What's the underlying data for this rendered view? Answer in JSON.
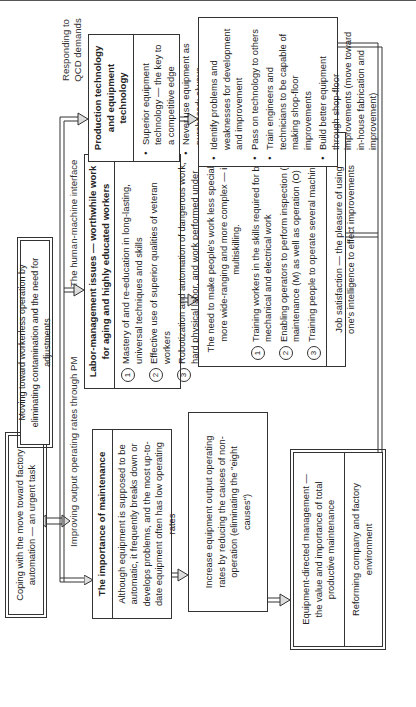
{
  "diagram": {
    "caption": "",
    "start_box": {
      "text": "Coping with the move toward factory automation — an urgent task"
    },
    "moving_box": {
      "text": "Moving toward workerless operation by eliminating contamination and the need for adjustments"
    },
    "labels": {
      "improving": "Improving output operating rates through PM",
      "human_machine": "The human-machine interface",
      "responding": "Responding to QCD demands"
    },
    "maintenance_box": {
      "title": "The importance of maintenance",
      "text": "Although equipment is supposed to be automatic, it frequently breaks down or develops problems, and the most up-to-date equipment often has low operating rates"
    },
    "increase_box": {
      "text": "Increase equipment output operating rates by reducing the causes of non-operation (eliminating the \"eight causes\")"
    },
    "equipment_box": {
      "main": "Equipment-directed management — the value and importance of total productive maintenance",
      "sub": "Reforming company and factory environment"
    },
    "labor_box": {
      "title": "Labor-management issues — worthwhile work for aging and highly educated workers",
      "items": [
        {
          "num": "1",
          "text": "Mastery of and re-education in long-lasting, universal techniques and skills"
        },
        {
          "num": "2",
          "text": "Effective use of superior qualities of veteran workers"
        },
        {
          "num": "3",
          "text": "Robotization and automation of dangerous work, hard physical labor, and work performed under unhealthy environmental conditions"
        }
      ]
    },
    "multiskill_box": {
      "intro": "The need to make people's work less specialized, more wide-ranging and more complex — i.e. multiskilling.",
      "items": [
        {
          "num": "1",
          "text": "Training workers in the skills required for both mechanical and electrical work"
        },
        {
          "num": "2",
          "text": "Enabling operators to perform inspection (I) and maintenance (M) as well as operation (O)"
        },
        {
          "num": "3",
          "text": "Training people to operate several machines"
        }
      ],
      "footer": "Job satisfaction — the pleasure of using one's intelligence to effect improvements"
    },
    "production_box": {
      "title": "Production technology and equipment technology",
      "bullets": [
        "Superior equipment technology — the key to a competitive edge",
        "Never use equipment as purchased; always modify and improve it."
      ]
    },
    "identify_box": {
      "bullets": [
        "Identify problems and weaknesses for development and improvement",
        "Pass on technology to others",
        "Train engineers and technicians to be capable of making shop-floor improvements",
        "Build better equipment through shop-floor improvements (move toward in-house fabrication and improvement)"
      ]
    }
  }
}
